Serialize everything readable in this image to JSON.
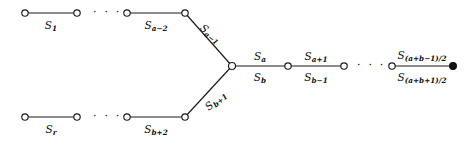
{
  "figure": {
    "kind": "graph-diagram",
    "width": 472,
    "height": 143,
    "colors": {
      "stroke": "#1a1a1a",
      "node_fill_open": "#ffffff",
      "node_fill_closed": "#111111",
      "background": "#ffffff",
      "text": "#111111"
    }
  },
  "nodes": [
    {
      "id": "n-top-1",
      "name": "node-top-left-start",
      "x": 25,
      "y": 13,
      "type": "open"
    },
    {
      "id": "n-top-2",
      "name": "node-top-left-end",
      "x": 77,
      "y": 13,
      "type": "open"
    },
    {
      "id": "n-top-3",
      "name": "node-top-am2-start",
      "x": 127,
      "y": 13,
      "type": "open"
    },
    {
      "id": "n-top-4",
      "name": "node-top-am2-end",
      "x": 185,
      "y": 13,
      "type": "open"
    },
    {
      "id": "n-bot-1",
      "name": "node-bottom-left-start",
      "x": 25,
      "y": 117,
      "type": "open"
    },
    {
      "id": "n-bot-2",
      "name": "node-bottom-left-end",
      "x": 77,
      "y": 117,
      "type": "open"
    },
    {
      "id": "n-bot-3",
      "name": "node-bottom-bp2-start",
      "x": 127,
      "y": 117,
      "type": "open"
    },
    {
      "id": "n-bot-4",
      "name": "node-bottom-bp2-end",
      "x": 185,
      "y": 117,
      "type": "open"
    },
    {
      "id": "n-junc",
      "name": "node-junction",
      "x": 232,
      "y": 66,
      "type": "open"
    },
    {
      "id": "n-right-1",
      "name": "node-right-first",
      "x": 288,
      "y": 66,
      "type": "open"
    },
    {
      "id": "n-right-2",
      "name": "node-right-second",
      "x": 344,
      "y": 66,
      "type": "open"
    },
    {
      "id": "n-right-3",
      "name": "node-right-tail-start",
      "x": 392,
      "y": 66,
      "type": "open"
    },
    {
      "id": "n-right-4",
      "name": "node-right-terminal",
      "x": 453,
      "y": 66,
      "type": "filled"
    }
  ],
  "edges": [
    {
      "name": "edge-s1",
      "from": "n-top-1",
      "to": "n-top-2"
    },
    {
      "name": "edge-sa-minus-2",
      "from": "n-top-3",
      "to": "n-top-4"
    },
    {
      "name": "edge-sa-minus-1",
      "from": "n-top-4",
      "to": "n-junc"
    },
    {
      "name": "edge-sr",
      "from": "n-bot-1",
      "to": "n-bot-2"
    },
    {
      "name": "edge-sb-plus-2",
      "from": "n-bot-3",
      "to": "n-bot-4"
    },
    {
      "name": "edge-sb-plus-1",
      "from": "n-bot-4",
      "to": "n-junc"
    },
    {
      "name": "edge-sa-sb",
      "from": "n-junc",
      "to": "n-right-1"
    },
    {
      "name": "edge-sa1-sb1",
      "from": "n-right-1",
      "to": "n-right-2"
    },
    {
      "name": "edge-tail",
      "from": "n-right-3",
      "to": "n-right-4"
    }
  ],
  "labels": {
    "s_1": {
      "base": "S",
      "sub": "1",
      "x": 51,
      "y": 20
    },
    "s_a_minus_2": {
      "base": "S",
      "sub": "a−2",
      "x": 156,
      "y": 20
    },
    "s_a_minus_1": {
      "base": "S",
      "sub": "a−1",
      "x": 211,
      "y": 26
    },
    "s_r": {
      "base": "S",
      "sub": "r",
      "x": 51,
      "y": 124
    },
    "s_b_plus_2": {
      "base": "S",
      "sub": "b+2",
      "x": 156,
      "y": 124
    },
    "s_b_plus_1": {
      "base": "S",
      "sub": "b+1",
      "x": 211,
      "y": 100
    },
    "s_a": {
      "base": "S",
      "sub": "a",
      "x": 260,
      "y": 55
    },
    "s_b": {
      "base": "S",
      "sub": "b",
      "x": 260,
      "y": 79
    },
    "s_a_plus_1": {
      "base": "S",
      "sub": "a+1",
      "x": 316,
      "y": 55
    },
    "s_b_minus_1": {
      "base": "S",
      "sub": "b−1",
      "x": 316,
      "y": 79
    },
    "s_ab_minus": {
      "base": "S",
      "sub": "(a+b−1)/2",
      "x": 422,
      "y": 55
    },
    "s_ab_plus": {
      "base": "S",
      "sub": "(a+b+1)/2",
      "x": 422,
      "y": 79
    }
  },
  "ellipses": [
    {
      "name": "ellipsis-top",
      "text": "· · ·",
      "x": 102,
      "y": 12
    },
    {
      "name": "ellipsis-bottom",
      "text": "· · ·",
      "x": 102,
      "y": 116
    },
    {
      "name": "ellipsis-right",
      "text": "· · ·",
      "x": 366,
      "y": 65
    }
  ]
}
